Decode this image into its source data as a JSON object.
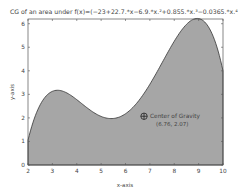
{
  "chart_data": {
    "type": "area",
    "title": "CG of an area under f(x)=(−23+22.7.*x−6.9.*x.²+0.855.*x.³−0.0365.*x.⁴)",
    "xlabel": "x-axis",
    "ylabel": "y-axis",
    "xlim": [
      2,
      10
    ],
    "ylim": [
      0,
      6.2
    ],
    "xticks": [
      2,
      3,
      4,
      5,
      6,
      7,
      8,
      9,
      10
    ],
    "yticks": [
      0,
      1,
      2,
      3,
      4,
      5,
      6
    ],
    "coefficients": [
      -23,
      22.7,
      -6.9,
      0.855,
      -0.0365
    ],
    "x": [
      2,
      3,
      4,
      5,
      6,
      7,
      8,
      9,
      10
    ],
    "values": [
      1.06,
      3.13,
      2.78,
      2.06,
      2.18,
      3.43,
      5.26,
      6.22,
      4.0
    ],
    "fill_color": "#a6a6a6",
    "line_color": "#333333",
    "grid": false,
    "annotation": {
      "label": "Center of Gravity",
      "coords_label": "(6.76, 2.07)",
      "x": 6.76,
      "y": 2.07,
      "marker": "circle-plus"
    }
  }
}
